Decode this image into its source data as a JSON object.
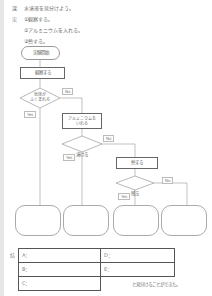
{
  "header": {
    "theme_mark": "課",
    "theme_text": "水溶液を見分けよう。",
    "plan_mark": "実",
    "plan_steps": [
      "①観察する。",
      "②アルミニウムを入れる。",
      "③熱する。"
    ]
  },
  "flowchart": {
    "start": "実験開始",
    "step1": "観察する",
    "decision1": [
      "気体が",
      "ふくまれる"
    ],
    "step2": [
      "アルミニウムを",
      "いれる"
    ],
    "decision2": "溶ける",
    "step3": "熱する",
    "decision3": "残る",
    "yes_label": "Yes",
    "no_label": "No",
    "results": [
      "",
      "",
      "",
      ""
    ]
  },
  "answer": {
    "mark": "結",
    "cells": [
      {
        "label": "A："
      },
      {
        "label": "B："
      },
      {
        "label": "C："
      },
      {
        "label": "D："
      },
      {
        "label": "E："
      }
    ],
    "conclusion": "と見分けることができた。"
  },
  "colors": {
    "line": "#999999",
    "box_border": "#666666",
    "background": "#ffffff",
    "strip": "#e6e6e6"
  }
}
